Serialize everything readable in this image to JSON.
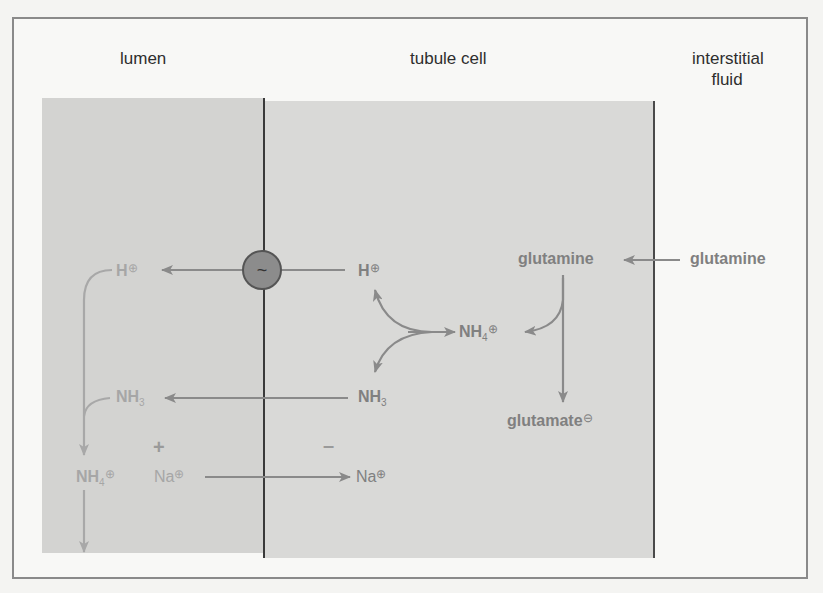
{
  "diagram": {
    "type": "renal ammonia excretion / acid secretion",
    "compartments": {
      "lumen": "lumen",
      "cell": "tubule cell",
      "interstitial_line1": "interstitial",
      "interstitial_line2": "fluid"
    },
    "transporter": {
      "symbol": "~",
      "description": "H+ pump (ATP-driven)"
    },
    "species": {
      "lumen_h": {
        "base": "H",
        "charge": "⊕"
      },
      "cell_h": {
        "base": "H",
        "charge": "⊕"
      },
      "lumen_nh3": {
        "base": "NH",
        "sub": "3"
      },
      "cell_nh3": {
        "base": "NH",
        "sub": "3"
      },
      "lumen_nh4": {
        "base": "NH",
        "sub": "4",
        "charge": "⊕"
      },
      "cell_nh4": {
        "base": "NH",
        "sub": "4",
        "charge": "⊕"
      },
      "lumen_na": {
        "base": "Na",
        "charge": "⊕"
      },
      "cell_na": {
        "base": "Na",
        "charge": "⊕"
      },
      "cell_glutamine": {
        "base": "glutamine"
      },
      "fluid_glutamine": {
        "base": "glutamine"
      },
      "glutamate": {
        "base": "glutamate",
        "charge": "⊖"
      }
    },
    "signs": {
      "lumen": "+",
      "cell": "–"
    },
    "colors": {
      "lumen_bg": "#d3d3d1",
      "cell_bg": "#d9d9d7",
      "fluid_bg": "#f8f8f6",
      "arrow": "#8a8a8a",
      "membrane": "#3a3a3a",
      "transporter": "#8c8c8c"
    }
  }
}
